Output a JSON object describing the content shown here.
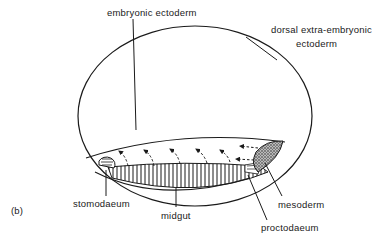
{
  "figure": {
    "panel_label": "(b)",
    "labels": {
      "embryonic_ectoderm": "embryonic ectoderm",
      "dorsal_line1": "dorsal extra-embryonic",
      "dorsal_line2": "ectoderm",
      "stomodaeum": "stomodaeum",
      "midgut": "midgut",
      "mesoderm": "mesoderm",
      "proctodaeum": "proctodaeum"
    },
    "colors": {
      "line": "#1a1a1a",
      "background": "#ffffff",
      "stipple": "#555555"
    }
  }
}
